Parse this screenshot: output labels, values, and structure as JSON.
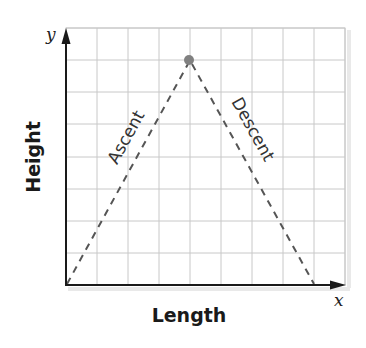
{
  "diagram": {
    "type": "mountain-path",
    "x_axis": {
      "variable": "x",
      "title": "Length"
    },
    "y_axis": {
      "variable": "y",
      "title": "Height"
    },
    "grid": {
      "columns": 9,
      "rows": 8
    },
    "segments": [
      {
        "label": "Ascent",
        "from": [
          0,
          0
        ],
        "to": [
          4,
          7
        ],
        "style": "dashed"
      },
      {
        "label": "Descent",
        "from": [
          4,
          7
        ],
        "to": [
          8,
          0
        ],
        "style": "dashed"
      }
    ],
    "peak_point": {
      "x": 4,
      "y": 7,
      "color": "#808080"
    },
    "colors": {
      "grid": "#c8c8c8",
      "axis": "#1a1a1a",
      "dashed_path": "#555555",
      "peak": "#808080"
    }
  }
}
